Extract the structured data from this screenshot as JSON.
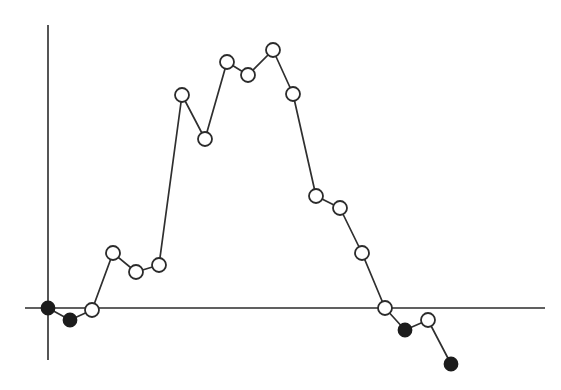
{
  "figure": {
    "background_color": "#ffffff",
    "line_color": "#2f2f2f",
    "axis_color": "#2b2b2b",
    "marker_open_fill": "#ffffff",
    "marker_filled_fill": "#1c1c1c",
    "marker_radius": 7,
    "filled_marker_radius": 6.5,
    "width": 561,
    "height": 390
  },
  "axes": {
    "x_axis": {
      "x1": 25,
      "y1": 308,
      "x2": 545,
      "y2": 308
    },
    "y_axis": {
      "x1": 48,
      "y1": 25,
      "x2": 48,
      "y2": 360
    }
  },
  "chart_data": {
    "type": "line",
    "title": "",
    "subtitle": "",
    "xlabel": "",
    "ylabel": "",
    "grid": false,
    "legend": null,
    "legend_position": "none",
    "xlim": [
      0,
      20
    ],
    "ylim": [
      -2,
      10
    ],
    "x": [
      0,
      1,
      2,
      3,
      4,
      5,
      6,
      7,
      8,
      9,
      10,
      11,
      12,
      13,
      14,
      15,
      16,
      17,
      18
    ],
    "values": [
      0,
      -0.55,
      0.1,
      2.7,
      1.8,
      2.1,
      10.0,
      7.8,
      11.6,
      11.0,
      12.2,
      10.0,
      5.3,
      4.7,
      2.6,
      0,
      -1.1,
      -0.6,
      -2.6
    ],
    "marker_styles": [
      "filled",
      "filled",
      "open",
      "open",
      "open",
      "open",
      "open",
      "open",
      "open",
      "open",
      "open",
      "open",
      "open",
      "open",
      "open",
      "open",
      "filled",
      "open",
      "filled"
    ],
    "points_pixels": [
      {
        "x": 48,
        "y": 308,
        "style": "filled"
      },
      {
        "x": 70,
        "y": 320,
        "style": "filled"
      },
      {
        "x": 92,
        "y": 310,
        "style": "open"
      },
      {
        "x": 113,
        "y": 253,
        "style": "open"
      },
      {
        "x": 136,
        "y": 272,
        "style": "open"
      },
      {
        "x": 159,
        "y": 265,
        "style": "open"
      },
      {
        "x": 182,
        "y": 95,
        "style": "open"
      },
      {
        "x": 205,
        "y": 139,
        "style": "open"
      },
      {
        "x": 227,
        "y": 62,
        "style": "open"
      },
      {
        "x": 248,
        "y": 75,
        "style": "open"
      },
      {
        "x": 273,
        "y": 50,
        "style": "open"
      },
      {
        "x": 293,
        "y": 94,
        "style": "open"
      },
      {
        "x": 316,
        "y": 196,
        "style": "open"
      },
      {
        "x": 340,
        "y": 208,
        "style": "open"
      },
      {
        "x": 362,
        "y": 253,
        "style": "open"
      },
      {
        "x": 385,
        "y": 308,
        "style": "open"
      },
      {
        "x": 405,
        "y": 330,
        "style": "filled"
      },
      {
        "x": 428,
        "y": 320,
        "style": "open"
      },
      {
        "x": 451,
        "y": 364,
        "style": "filled"
      }
    ],
    "xtick_labels": [],
    "ytick_labels": [],
    "annotations": []
  }
}
